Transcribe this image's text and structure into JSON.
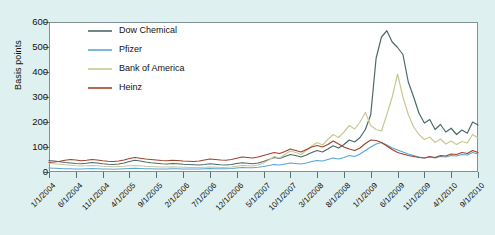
{
  "chart_data": {
    "type": "line",
    "title": "",
    "xlabel": "",
    "ylabel": "Basis points",
    "ylim": [
      0,
      600
    ],
    "yticks": [
      0,
      100,
      200,
      300,
      400,
      500,
      600
    ],
    "grid": false,
    "legend_position": "top-left",
    "x_tick_labels": [
      "1/1/2004",
      "6/1/2004",
      "11/1/2004",
      "4/1/2005",
      "9/1/2005",
      "2/1/2006",
      "7/1/2006",
      "12/1/2006",
      "5/1/2007",
      "10/1/2007",
      "3/1/2008",
      "8/1/2008",
      "1/1/2009",
      "6/1/2009",
      "11/1/2009",
      "4/1/2010",
      "9/1/2010"
    ],
    "x_index_range": [
      0,
      80
    ],
    "x_tick_indices": [
      0,
      5,
      10,
      15,
      20,
      25,
      30,
      35,
      40,
      45,
      50,
      55,
      60,
      65,
      70,
      75,
      80
    ],
    "series": [
      {
        "name": "Dow Chemical",
        "color": "#4d6a6a",
        "values": [
          46,
          44,
          41,
          38,
          36,
          34,
          33,
          35,
          38,
          36,
          33,
          31,
          30,
          32,
          36,
          42,
          47,
          44,
          40,
          37,
          35,
          33,
          32,
          34,
          33,
          31,
          30,
          29,
          28,
          30,
          33,
          31,
          29,
          28,
          30,
          34,
          37,
          35,
          33,
          36,
          42,
          50,
          58,
          54,
          62,
          70,
          66,
          60,
          68,
          78,
          86,
          80,
          92,
          105,
          96,
          110,
          128,
          120,
          138,
          170,
          230,
          455,
          540,
          565,
          520,
          498,
          470,
          360,
          300,
          235,
          196,
          210,
          170,
          190,
          160,
          175,
          150,
          168,
          155,
          200,
          188
        ]
      },
      {
        "name": "Pfizer",
        "color": "#58a6d6",
        "values": [
          16,
          15,
          14,
          13,
          13,
          12,
          12,
          13,
          14,
          13,
          12,
          12,
          11,
          12,
          13,
          14,
          15,
          14,
          13,
          13,
          12,
          12,
          12,
          13,
          13,
          12,
          12,
          12,
          12,
          13,
          14,
          13,
          13,
          13,
          14,
          16,
          18,
          17,
          17,
          19,
          22,
          26,
          30,
          28,
          32,
          36,
          34,
          32,
          36,
          42,
          46,
          44,
          50,
          56,
          52,
          58,
          66,
          62,
          72,
          86,
          100,
          112,
          118,
          108,
          96,
          88,
          80,
          72,
          66,
          60,
          56,
          60,
          56,
          62,
          60,
          66,
          64,
          70,
          68,
          78,
          72
        ]
      },
      {
        "name": "Bank of America",
        "color": "#c9c894",
        "values": [
          34,
          33,
          31,
          29,
          27,
          25,
          24,
          25,
          26,
          25,
          23,
          22,
          21,
          22,
          23,
          25,
          26,
          25,
          23,
          22,
          21,
          20,
          20,
          21,
          20,
          19,
          18,
          18,
          18,
          19,
          20,
          19,
          18,
          18,
          20,
          23,
          26,
          25,
          24,
          28,
          36,
          48,
          62,
          56,
          70,
          84,
          78,
          70,
          86,
          104,
          118,
          108,
          130,
          150,
          138,
          160,
          186,
          172,
          200,
          238,
          186,
          170,
          164,
          230,
          300,
          392,
          300,
          230,
          180,
          150,
          130,
          140,
          118,
          132,
          112,
          124,
          110,
          122,
          116,
          150,
          136
        ]
      },
      {
        "name": "Heinz",
        "color": "#a14329",
        "values": [
          38,
          40,
          43,
          47,
          50,
          48,
          45,
          47,
          50,
          48,
          45,
          43,
          42,
          44,
          48,
          54,
          58,
          55,
          52,
          50,
          48,
          46,
          45,
          47,
          46,
          44,
          43,
          42,
          44,
          48,
          52,
          50,
          48,
          47,
          50,
          55,
          60,
          58,
          56,
          60,
          66,
          72,
          78,
          74,
          82,
          92,
          86,
          80,
          90,
          100,
          106,
          100,
          110,
          124,
          112,
          100,
          92,
          86,
          96,
          114,
          128,
          126,
          118,
          104,
          90,
          78,
          72,
          66,
          62,
          58,
          56,
          62,
          58,
          66,
          64,
          72,
          70,
          78,
          74,
          86,
          78
        ]
      }
    ]
  },
  "legend": {
    "items": [
      {
        "label": "Dow Chemical"
      },
      {
        "label": "Pfizer"
      },
      {
        "label": "Bank of America"
      },
      {
        "label": "Heinz"
      }
    ]
  },
  "colors": {
    "background": "#dff0f0",
    "plot_background": "#ffffff",
    "axis": "#5a6f73",
    "text": "#111111"
  }
}
